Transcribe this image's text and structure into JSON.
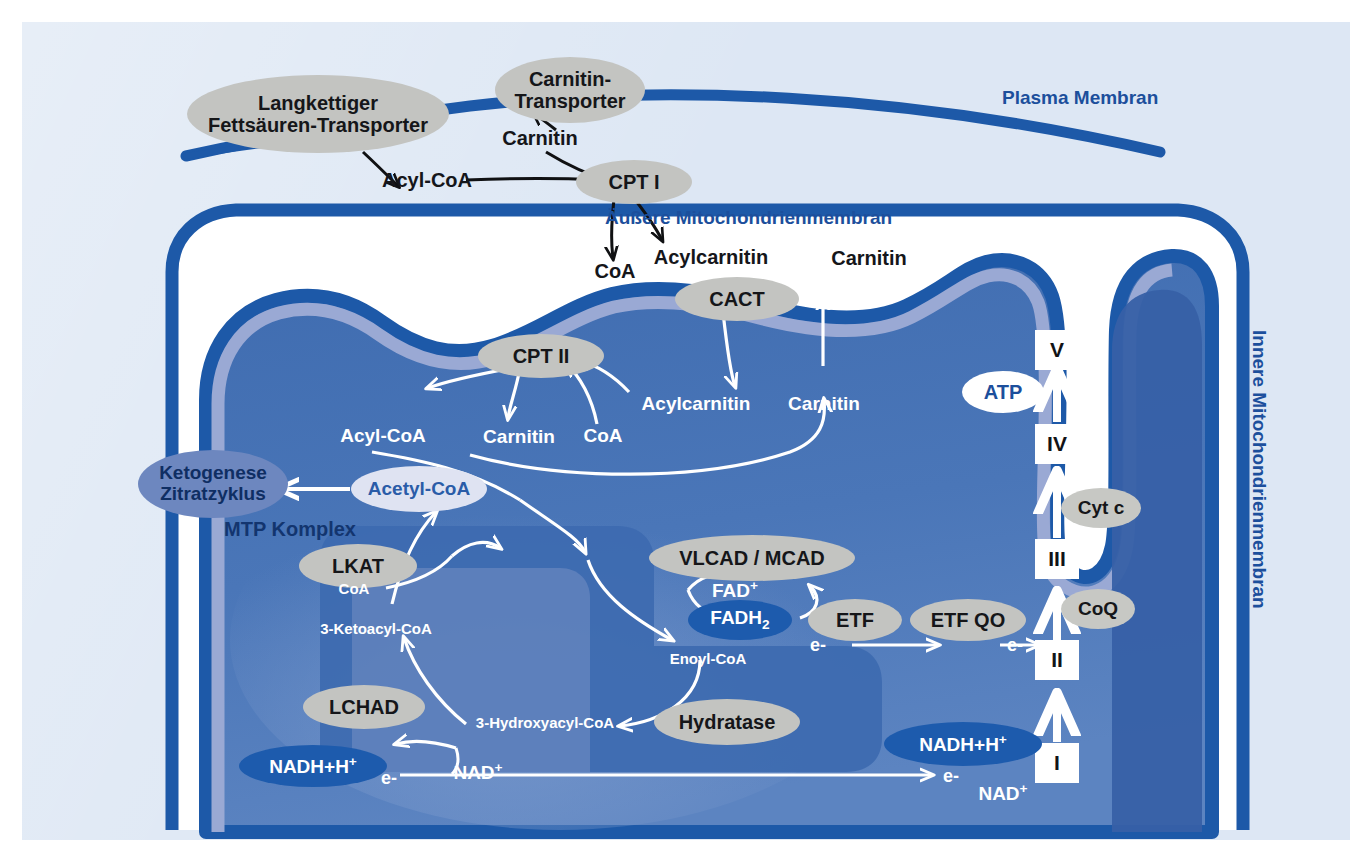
{
  "figure": {
    "colors": {
      "background_panel": "#dde7f4",
      "membrane_blue": "#1d59a8",
      "matrix_blue": "#3f6cb0",
      "inner_band_lavender": "#9aa9d4",
      "enzyme_grey": "#c3c4c1",
      "node_dark_blue": "#1d5bad",
      "text_navy": "#1c4f9c"
    }
  },
  "membranes": {
    "plasma": "Plasma Membran",
    "outer_mitochondrial": "Äußere Mitochondrienmembran",
    "inner_mitochondrial": "Innere Mitochondrienmembran"
  },
  "transporters": {
    "fatty_acid": "Langkettiger\nFettsäuren-Transporter",
    "fatty_acid_line1": "Langkettiger",
    "fatty_acid_line2": "Fettsäuren-Transporter",
    "carnitine_line1": "Carnitin-",
    "carnitine_line2": "Transporter"
  },
  "enzymes": {
    "cpt1": "CPT I",
    "cpt2": "CPT II",
    "cact": "CACT",
    "vlcad_mcad": "VLCAD / MCAD",
    "lkat": "LKAT",
    "lchad": "LCHAD",
    "hydratase": "Hydratase",
    "etf": "ETF",
    "etfqo": "ETF QO",
    "cytc": "Cyt c",
    "coq": "CoQ",
    "mtp_complex": "MTP Komplex"
  },
  "metabolites": {
    "carnitin_cytosol": "Carnitin",
    "acyl_coa_cytosol": "Acyl-CoA",
    "acylcarnitin_ims": "Acylcarnitin",
    "coa_ims": "CoA",
    "carnitin_ims": "Carnitin",
    "acylcarnitin_matrix": "Acylcarnitin",
    "carnitin_matrix_mid": "Carnitin",
    "carnitin_matrix_right": "Carnitin",
    "coa_matrix": "CoA",
    "acyl_coa_matrix": "Acyl-CoA",
    "carnitin_matrix": "Carnitin",
    "coa_mtp": "CoA",
    "ketoacyl": "3-Ketoacyl-CoA",
    "hydroxyacyl": "3-Hydroxyacyl-CoA",
    "enoyl": "Enoyl-CoA",
    "acetyl_coa": "Acetyl-CoA"
  },
  "cofactors": {
    "fad": "FAD",
    "fad_sup": "+",
    "fadh2": "FADH",
    "fadh2_sub": "2",
    "nadh_left": "NADH+H",
    "nadh_left_sup": "+",
    "nad_left": "NAD",
    "nad_left_sup": "+",
    "nadh_right": "NADH+H",
    "nadh_right_sup": "+",
    "nad_right": "NAD",
    "nad_right_sup": "+",
    "atp": "ATP"
  },
  "electrons": {
    "e_fadh2": "e-",
    "e_etfqo": "e-",
    "e_nadh_left": "e-",
    "e_nadh_right": "e-"
  },
  "destination": {
    "line1": "Ketogenese",
    "line2": "Zitratzyklus"
  },
  "respiratory_chain": {
    "complexes": [
      "I",
      "II",
      "III",
      "IV",
      "V"
    ],
    "mobile_carriers": [
      "CoQ",
      "Cyt c"
    ],
    "product": "ATP"
  }
}
